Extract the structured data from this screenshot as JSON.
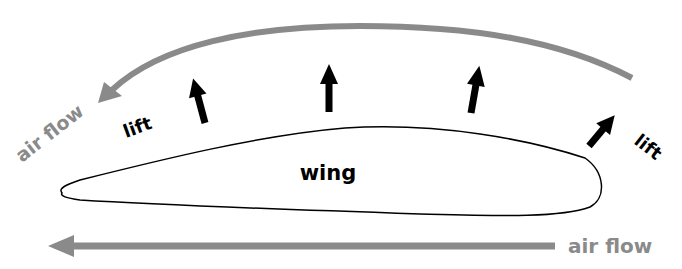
{
  "diagram": {
    "labels": {
      "wing": "wing",
      "lift_left": "lift",
      "lift_right": "lift",
      "airflow_top": "air flow",
      "airflow_bottom": "air flow"
    },
    "colors": {
      "airflow": "#8a8a8a",
      "lift": "#000000",
      "wing_outline": "#000000",
      "background": "#ffffff"
    },
    "lift_arrow_count": 4
  }
}
